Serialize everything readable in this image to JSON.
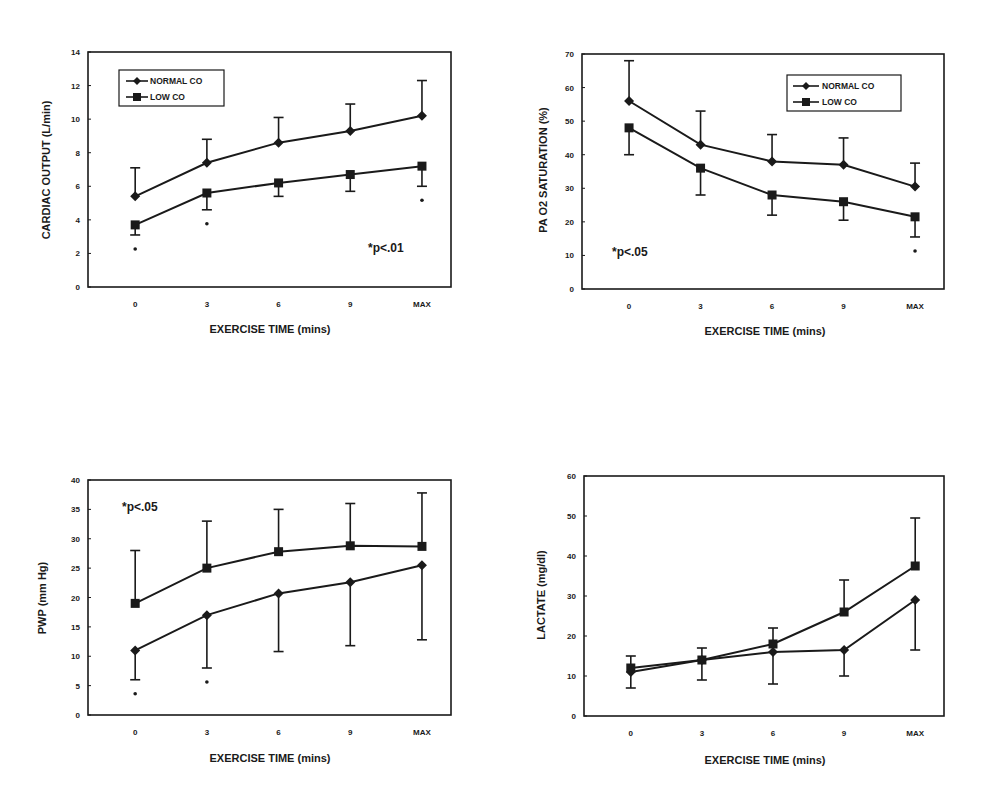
{
  "chart_data": [
    {
      "id": "cardiac-output",
      "type": "line",
      "title": "",
      "xlabel": "EXERCISE TIME (mins)",
      "ylabel": "CARDIAC OUTPUT (L/min)",
      "categories": [
        "0",
        "3",
        "6",
        "9",
        "MAX"
      ],
      "ylim": [
        0,
        14
      ],
      "yticks": [
        0,
        2,
        4,
        6,
        8,
        10,
        12,
        14
      ],
      "grid": false,
      "legend": {
        "position": "upper-left",
        "entries": [
          "NORMAL CO",
          "LOW CO"
        ]
      },
      "annotation": "*p<.01",
      "series": [
        {
          "name": "NORMAL CO",
          "marker": "diamond",
          "values": [
            5.4,
            7.4,
            8.6,
            9.3,
            10.2
          ],
          "error_up": [
            7.1,
            8.8,
            10.1,
            10.9,
            12.3
          ],
          "error_dir": "up"
        },
        {
          "name": "LOW CO",
          "marker": "square",
          "values": [
            3.7,
            5.6,
            6.2,
            6.7,
            7.2
          ],
          "error_down": [
            3.1,
            4.6,
            5.4,
            5.7,
            6.0
          ],
          "error_dir": "down"
        }
      ],
      "significance_markers": [
        "0",
        "3",
        "MAX"
      ]
    },
    {
      "id": "pa-o2-saturation",
      "type": "line",
      "title": "",
      "xlabel": "EXERCISE TIME (mins)",
      "ylabel": "PA O2 SATURATION (%)",
      "categories": [
        "0",
        "3",
        "6",
        "9",
        "MAX"
      ],
      "ylim": [
        0,
        70
      ],
      "yticks": [
        0,
        10,
        20,
        30,
        40,
        50,
        60,
        70
      ],
      "grid": false,
      "legend": {
        "position": "upper-right",
        "entries": [
          "NORMAL CO",
          "LOW CO"
        ]
      },
      "annotation": "*p<.05",
      "series": [
        {
          "name": "NORMAL CO",
          "marker": "diamond",
          "values": [
            56,
            43,
            38,
            37,
            30.5
          ],
          "error_up": [
            68,
            53,
            46,
            45,
            37.5
          ],
          "error_dir": "up"
        },
        {
          "name": "LOW CO",
          "marker": "square",
          "values": [
            48,
            36,
            28,
            26,
            21.5
          ],
          "error_down": [
            40,
            28,
            22,
            20.5,
            15.5
          ],
          "error_dir": "down"
        }
      ],
      "significance_markers": [
        "MAX"
      ]
    },
    {
      "id": "pwp",
      "type": "line",
      "title": "",
      "xlabel": "EXERCISE TIME (mins)",
      "ylabel": "PWP (mm Hg)",
      "categories": [
        "0",
        "3",
        "6",
        "9",
        "MAX"
      ],
      "ylim": [
        0,
        40
      ],
      "yticks": [
        0,
        5,
        10,
        15,
        20,
        25,
        30,
        35,
        40
      ],
      "grid": false,
      "annotation": "*p<.05",
      "series": [
        {
          "name": "LOW CO",
          "marker": "square",
          "values": [
            19,
            25,
            27.8,
            28.8,
            28.7
          ],
          "error_up": [
            28,
            33,
            35,
            36,
            37.8
          ],
          "error_dir": "up"
        },
        {
          "name": "NORMAL CO",
          "marker": "diamond",
          "values": [
            11,
            17,
            20.7,
            22.6,
            25.5
          ],
          "error_down": [
            6,
            8,
            10.8,
            11.8,
            12.8
          ],
          "error_dir": "down"
        }
      ],
      "significance_markers": [
        "0",
        "3"
      ]
    },
    {
      "id": "lactate",
      "type": "line",
      "title": "",
      "xlabel": "EXERCISE TIME (mins)",
      "ylabel": "LACTATE (mg/dl)",
      "categories": [
        "0",
        "3",
        "6",
        "9",
        "MAX"
      ],
      "ylim": [
        0,
        60
      ],
      "yticks": [
        0,
        10,
        20,
        30,
        40,
        50,
        60
      ],
      "grid": false,
      "series": [
        {
          "name": "LOW CO",
          "marker": "square",
          "values": [
            12,
            14,
            18,
            26,
            37.5
          ],
          "error_up": [
            15,
            17,
            22,
            34,
            49.5
          ],
          "error_dir": "up"
        },
        {
          "name": "NORMAL CO",
          "marker": "diamond",
          "values": [
            11,
            14,
            16,
            16.5,
            29
          ],
          "error_down": [
            7,
            9,
            8,
            10,
            16.5
          ],
          "error_dir": "down"
        }
      ],
      "significance_markers": []
    }
  ],
  "panels": {
    "cardiac_output": {
      "ylabel": "CARDIAC OUTPUT (L/min)",
      "xlabel": "EXERCISE TIME (mins)",
      "annotation": "*p<.01",
      "legend_normal": "NORMAL CO",
      "legend_low": "LOW CO"
    },
    "pa_o2": {
      "ylabel": "PA O2 SATURATION (%)",
      "xlabel": "EXERCISE TIME (mins)",
      "annotation": "*p<.05",
      "legend_normal": "NORMAL CO",
      "legend_low": "LOW CO"
    },
    "pwp": {
      "ylabel": "PWP (mm Hg)",
      "xlabel": "EXERCISE TIME (mins)",
      "annotation": "*p<.05"
    },
    "lactate": {
      "ylabel": "LACTATE (mg/dl)",
      "xlabel": "EXERCISE TIME (mins)"
    }
  }
}
